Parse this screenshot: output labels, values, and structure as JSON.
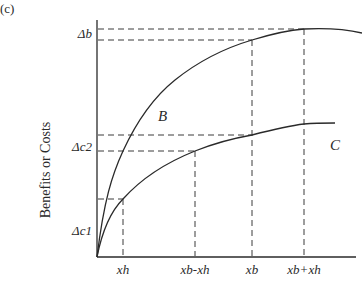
{
  "figure": {
    "panel_label": "(c)",
    "y_axis_title": "Benefits or Costs",
    "x_ticks": [
      {
        "label": "xh",
        "x": 123
      },
      {
        "label": "xb-xh",
        "x": 195
      },
      {
        "label": "xb",
        "x": 252
      },
      {
        "label": "xb+xh",
        "x": 304
      }
    ],
    "y_ticks": [
      {
        "label": "Δb",
        "y": 34
      },
      {
        "label": "Δc2",
        "y": 146
      },
      {
        "label": "Δc1",
        "y": 230
      }
    ],
    "curves": [
      {
        "name": "B",
        "label": "B",
        "description": "Concave benefit curve rising from origin to a peak near xb+xh"
      },
      {
        "name": "C",
        "label": "C",
        "description": "Concave cost curve rising from origin, flatter than B"
      }
    ],
    "guide_lines": {
      "horizontal_y": [
        29,
        40,
        135,
        151,
        199
      ],
      "vertical_x": [
        123,
        195,
        252,
        304
      ]
    }
  }
}
